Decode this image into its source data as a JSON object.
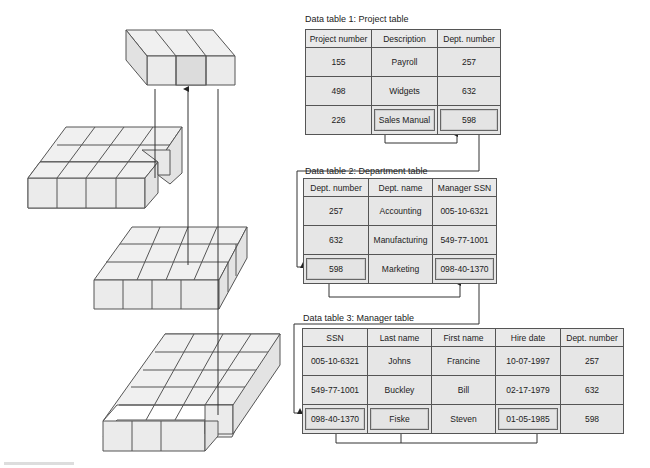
{
  "tables": [
    {
      "caption": "Data table 1: Project table",
      "headers": [
        "Project number",
        "Description",
        "Dept. number"
      ],
      "rows": [
        [
          "155",
          "Payroll",
          "257"
        ],
        [
          "498",
          "Widgets",
          "632"
        ],
        [
          "226",
          "Sales Manual",
          "598"
        ]
      ],
      "highlighted_cells": [
        "2.1",
        "2.2"
      ]
    },
    {
      "caption": "Data table 2: Department table",
      "headers": [
        "Dept. number",
        "Dept. name",
        "Manager SSN"
      ],
      "rows": [
        [
          "257",
          "Accounting",
          "005-10-6321"
        ],
        [
          "632",
          "Manufacturing",
          "549-77-1001"
        ],
        [
          "598",
          "Marketing",
          "098-40-1370"
        ]
      ],
      "highlighted_cells": [
        "2.0",
        "2.2"
      ]
    },
    {
      "caption": "Data table 3: Manager table",
      "headers": [
        "SSN",
        "Last name",
        "First name",
        "Hire date",
        "Dept. number"
      ],
      "rows": [
        [
          "005-10-6321",
          "Johns",
          "Francine",
          "10-07-1997",
          "257"
        ],
        [
          "549-77-1001",
          "Buckley",
          "Bill",
          "02-17-1979",
          "632"
        ],
        [
          "098-40-1370",
          "Fiske",
          "Steven",
          "01-05-1985",
          "598"
        ]
      ],
      "highlighted_cells": [
        "2.0",
        "2.1",
        "2.3"
      ]
    }
  ],
  "cube_diagrams": [
    "project-slice",
    "project-cube",
    "department-cube",
    "manager-cube"
  ],
  "colors": {
    "cell_bg": "#e6e6e6",
    "border": "#555555",
    "line": "#444444"
  }
}
